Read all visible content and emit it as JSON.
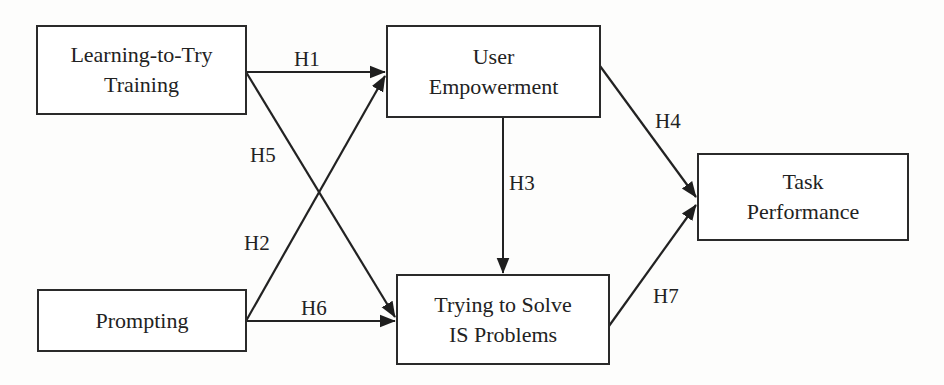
{
  "diagram": {
    "type": "research-model",
    "nodes": [
      {
        "id": "ltt",
        "lines": [
          "Learning-to-Try",
          "Training"
        ]
      },
      {
        "id": "ue",
        "lines": [
          "User",
          "Empowerment"
        ]
      },
      {
        "id": "tp",
        "lines": [
          "Task",
          "Performance"
        ]
      },
      {
        "id": "pr",
        "lines": [
          "Prompting"
        ]
      },
      {
        "id": "ts",
        "lines": [
          "Trying to Solve",
          "IS Problems"
        ]
      }
    ],
    "edges": [
      {
        "id": "H1",
        "label": "H1",
        "from": "Learning-to-Try Training",
        "to": "User Empowerment"
      },
      {
        "id": "H2",
        "label": "H2",
        "from": "Prompting",
        "to": "User Empowerment"
      },
      {
        "id": "H3",
        "label": "H3",
        "from": "User Empowerment",
        "to": "Trying to Solve IS Problems"
      },
      {
        "id": "H4",
        "label": "H4",
        "from": "User Empowerment",
        "to": "Task Performance"
      },
      {
        "id": "H5",
        "label": "H5",
        "from": "Learning-to-Try Training",
        "to": "Trying to Solve IS Problems"
      },
      {
        "id": "H6",
        "label": "H6",
        "from": "Prompting",
        "to": "Trying to Solve IS Problems"
      },
      {
        "id": "H7",
        "label": "H7",
        "from": "Trying to Solve IS Problems",
        "to": "Task Performance"
      }
    ],
    "colors": {
      "line": "#222222",
      "box_border": "#2a2a2a",
      "background": "#fdfdfc"
    }
  }
}
